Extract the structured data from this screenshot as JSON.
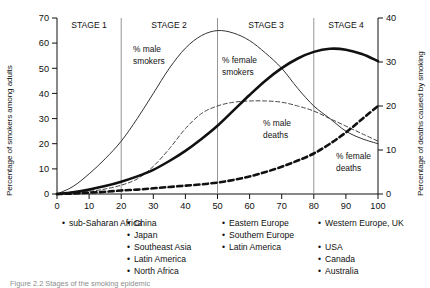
{
  "figure": {
    "caption": "Figure 2.2 Stages of the smoking epidemic"
  },
  "axes": {
    "left_title": "Percentage of smokers among adults",
    "right_title": "Percentage of deaths caused by smoking",
    "left_ticks": [
      "0",
      "10",
      "20",
      "30",
      "40",
      "50",
      "60",
      "70"
    ],
    "right_ticks": [
      "0",
      "10",
      "20",
      "30",
      "40"
    ],
    "x_ticks": [
      "0",
      "10",
      "20",
      "30",
      "40",
      "50",
      "60",
      "70",
      "80",
      "90",
      "100"
    ]
  },
  "stages": [
    {
      "label": "STAGE 1",
      "countries": [
        "sub-Saharan Africa"
      ]
    },
    {
      "label": "STAGE 2",
      "countries": [
        "China",
        "Japan",
        "Southeast Asia",
        "Latin America",
        "North Africa"
      ]
    },
    {
      "label": "STAGE 3",
      "countries": [
        "Eastern Europe",
        "Southern Europe",
        "Latin America"
      ]
    },
    {
      "label": "STAGE 4",
      "countries": [
        "Western Europe, UK",
        "USA",
        "Canada",
        "Australia"
      ]
    }
  ],
  "curve_labels": {
    "male_smokers": "% male\nsmokers",
    "male_smokers_line1": "% male",
    "male_smokers_line2": "smokers",
    "female_smokers_line1": "% female",
    "female_smokers_line2": "smokers",
    "male_deaths_line1": "% male",
    "male_deaths_line2": "deaths",
    "female_deaths_line1": "% female",
    "female_deaths_line2": "deaths"
  },
  "chart_data": {
    "type": "line",
    "title": "Stages of the smoking epidemic",
    "xlabel": "",
    "ylabel": "Percentage of smokers among adults",
    "y2label": "Percentage of deaths caused by smoking",
    "xlim": [
      0,
      100
    ],
    "ylim": [
      0,
      70
    ],
    "y2lim": [
      0,
      40
    ],
    "grid": false,
    "legend": "inline-annotations",
    "stage_boundaries": [
      20,
      50,
      80
    ],
    "x": [
      0,
      5,
      10,
      15,
      20,
      25,
      30,
      35,
      40,
      45,
      50,
      55,
      60,
      65,
      70,
      75,
      80,
      85,
      90,
      95,
      100
    ],
    "series": [
      {
        "name": "% male smokers",
        "axis": "left",
        "style": "thin-solid",
        "color": "#333333",
        "values": [
          0,
          3,
          8,
          14,
          21,
          30,
          40,
          50,
          58,
          63,
          65,
          64,
          61,
          56,
          50,
          42,
          35,
          30,
          25,
          22,
          20
        ]
      },
      {
        "name": "% female smokers",
        "axis": "left",
        "style": "thin-dashed",
        "color": "#444444",
        "values": [
          0,
          0.5,
          1,
          2,
          3.5,
          6,
          11,
          18,
          26,
          32,
          35,
          36.5,
          37,
          37,
          36.5,
          35,
          33,
          30,
          27,
          24,
          21
        ]
      },
      {
        "name": "% male deaths",
        "axis": "right",
        "style": "thick-solid",
        "color": "#111111",
        "values": [
          0,
          0.4,
          1,
          1.8,
          2.8,
          4,
          5.5,
          7.5,
          9.8,
          12.5,
          15.5,
          19,
          22.5,
          25.8,
          28.6,
          30.8,
          32.3,
          33,
          32.8,
          31.8,
          30.2
        ]
      },
      {
        "name": "% female deaths",
        "axis": "right",
        "style": "thick-dashed",
        "color": "#111111",
        "values": [
          0,
          0.1,
          0.3,
          0.5,
          0.8,
          1.0,
          1.3,
          1.6,
          1.9,
          2.2,
          2.6,
          3.2,
          4.0,
          5.0,
          6.2,
          7.6,
          9.2,
          11.4,
          14.0,
          17.0,
          20.0
        ]
      }
    ]
  }
}
